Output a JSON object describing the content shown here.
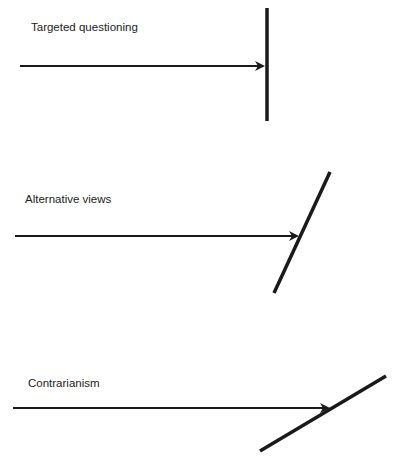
{
  "diagram": {
    "type": "arrow-barrier comparison",
    "colors": {
      "stroke": "#1a1a1a",
      "text": "#222222",
      "background": "#ffffff"
    },
    "panels": [
      {
        "label": "Targeted questioning",
        "label_pos": {
          "x": 31,
          "y": 22
        },
        "arrow": {
          "x1": 20,
          "y1": 66,
          "x2": 263,
          "y2": 66
        },
        "barrier": {
          "x1": 267,
          "y1": 8,
          "x2": 267,
          "y2": 121,
          "orientation": "vertical"
        }
      },
      {
        "label": "Alternative views",
        "label_pos": {
          "x": 25,
          "y": 194
        },
        "arrow": {
          "x1": 15,
          "y1": 236,
          "x2": 297,
          "y2": 236
        },
        "barrier": {
          "x1": 330,
          "y1": 172,
          "x2": 274,
          "y2": 293,
          "orientation": "steep diagonal"
        }
      },
      {
        "label": "Contrarianism",
        "label_pos": {
          "x": 28,
          "y": 378
        },
        "arrow": {
          "x1": 13,
          "y1": 408,
          "x2": 328,
          "y2": 408
        },
        "barrier": {
          "x1": 386,
          "y1": 376,
          "x2": 260,
          "y2": 451,
          "orientation": "shallow diagonal"
        }
      }
    ]
  }
}
